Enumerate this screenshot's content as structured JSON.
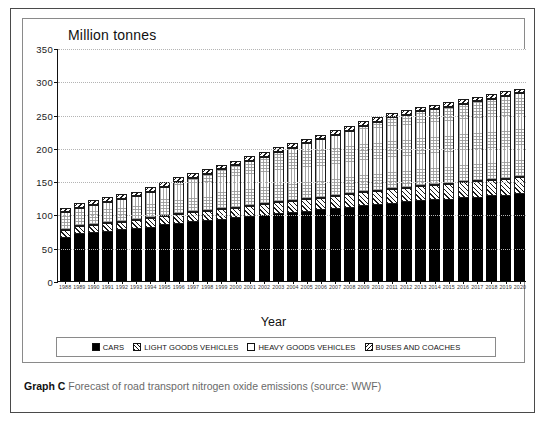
{
  "caption": {
    "label": "Graph C",
    "text": "Forecast of road transport nitrogen oxide emissions (source: WWF)"
  },
  "legend": {
    "items": [
      {
        "name": "cars",
        "label": "CARS",
        "pattern": "solid-black"
      },
      {
        "name": "light-goods-vehicles",
        "label": "LIGHT GOODS VEHICLES",
        "pattern": "forward-hatch"
      },
      {
        "name": "heavy-goods-vehicles",
        "label": "HEAVY GOODS VEHICLES",
        "pattern": "white"
      },
      {
        "name": "buses-and-coaches",
        "label": "BUSES AND COACHES",
        "pattern": "back-hatch"
      }
    ]
  },
  "chart_data": {
    "type": "bar",
    "stacked": true,
    "title": "Million tonnes",
    "xlabel": "Year",
    "ylabel": "Million tonnes",
    "ylim": [
      0,
      350
    ],
    "yticks": [
      0,
      50,
      100,
      150,
      200,
      250,
      300,
      350
    ],
    "grid": true,
    "legend_position": "bottom",
    "categories": [
      "1988",
      "1989",
      "1990",
      "1991",
      "1992",
      "1993",
      "1994",
      "1995",
      "1996",
      "1997",
      "1998",
      "1999",
      "2000",
      "2001",
      "2002",
      "2003",
      "2004",
      "2005",
      "2006",
      "2007",
      "2008",
      "2009",
      "2010",
      "2011",
      "2012",
      "2013",
      "2014",
      "2015",
      "2016",
      "2017",
      "2018",
      "2019",
      "2020"
    ],
    "series": [
      {
        "name": "CARS",
        "pattern": "solid-black",
        "values": [
          65,
          70,
          72,
          74,
          76,
          78,
          80,
          84,
          86,
          88,
          90,
          92,
          94,
          96,
          98,
          100,
          102,
          104,
          106,
          108,
          110,
          112,
          114,
          116,
          118,
          120,
          121,
          122,
          124,
          125,
          127,
          128,
          130
        ]
      },
      {
        "name": "LIGHT GOODS VEHICLES",
        "pattern": "forward-hatch",
        "values": [
          12,
          12,
          12,
          13,
          13,
          13,
          14,
          14,
          15,
          15,
          15,
          16,
          16,
          17,
          17,
          18,
          18,
          19,
          19,
          20,
          20,
          21,
          21,
          22,
          22,
          23,
          23,
          24,
          24,
          25,
          25,
          26,
          26
        ]
      },
      {
        "name": "HEAVY GOODS VEHICLES",
        "pattern": "white",
        "values": [
          26,
          28,
          30,
          32,
          34,
          36,
          40,
          44,
          48,
          52,
          56,
          60,
          64,
          68,
          72,
          76,
          80,
          84,
          88,
          92,
          96,
          100,
          104,
          108,
          110,
          112,
          114,
          116,
          118,
          120,
          122,
          124,
          126
        ]
      },
      {
        "name": "BUSES AND COACHES",
        "pattern": "back-hatch",
        "values": [
          7,
          7,
          7,
          7,
          7,
          7,
          7,
          7,
          7,
          7,
          7,
          7,
          7,
          7,
          7,
          7,
          7,
          7,
          7,
          7,
          7,
          7,
          7,
          7,
          7,
          7,
          7,
          7,
          7,
          7,
          7,
          7,
          7
        ]
      }
    ],
    "totals": [
      110,
      117,
      121,
      126,
      130,
      134,
      141,
      149,
      156,
      162,
      168,
      175,
      181,
      188,
      194,
      201,
      207,
      214,
      220,
      227,
      233,
      240,
      246,
      253,
      257,
      262,
      265,
      269,
      273,
      277,
      281,
      285,
      289
    ]
  }
}
